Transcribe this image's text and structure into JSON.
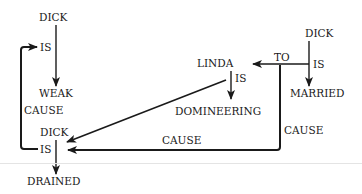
{
  "diagram": {
    "title": "",
    "nodes": [
      {
        "id": "dick_1",
        "label": "DICK"
      },
      {
        "id": "is_1",
        "label": "IS"
      },
      {
        "id": "weak",
        "label": "WEAK"
      },
      {
        "id": "cause_left",
        "label": "CAUSE"
      },
      {
        "id": "dick_2",
        "label": "DICK"
      },
      {
        "id": "is_2",
        "label": "IS"
      },
      {
        "id": "drained",
        "label": "DRAINED"
      },
      {
        "id": "linda",
        "label": "LINDA"
      },
      {
        "id": "is_3",
        "label": "IS"
      },
      {
        "id": "domineering",
        "label": "DOMINEERING"
      },
      {
        "id": "dick_3",
        "label": "DICK"
      },
      {
        "id": "to",
        "label": "TO"
      },
      {
        "id": "is_4",
        "label": "IS"
      },
      {
        "id": "married",
        "label": "MARRIED"
      },
      {
        "id": "cause_bottom",
        "label": "CAUSE"
      },
      {
        "id": "cause_right",
        "label": "CAUSE"
      }
    ],
    "edges": [
      {
        "from": "DICK",
        "to": "WEAK",
        "relation": "IS"
      },
      {
        "from": "DICK IS DRAINED",
        "to": "DICK IS WEAK",
        "relation": "CAUSE"
      },
      {
        "from": "DICK",
        "to": "DRAINED",
        "relation": "IS"
      },
      {
        "from": "LINDA",
        "to": "DOMINEERING",
        "relation": "IS"
      },
      {
        "from": "LINDA IS DOMINEERING",
        "to": "DICK IS DRAINED",
        "relation": ""
      },
      {
        "from": "DICK",
        "to": "MARRIED",
        "relation": "IS"
      },
      {
        "from": "DICK IS MARRIED",
        "to": "LINDA",
        "relation": "TO"
      },
      {
        "from": "DICK IS MARRIED TO LINDA",
        "to": "DICK IS DRAINED",
        "relation": "CAUSE"
      }
    ],
    "colors": {
      "ink": "#1a1a1a",
      "background": "#ffffff",
      "divider": "#e4e4e4"
    }
  }
}
